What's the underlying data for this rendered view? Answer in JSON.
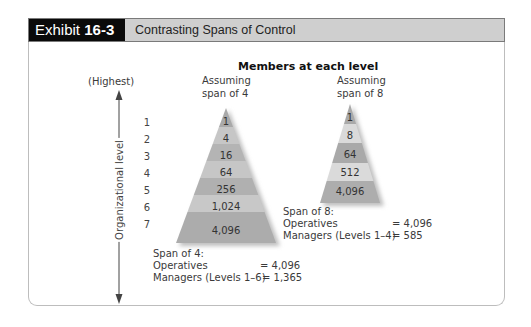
{
  "header": {
    "exhibit_prefix": "Exhibit",
    "exhibit_number": "16-3",
    "title": "Contrasting Spans of Control"
  },
  "diagram": {
    "title": "Members at each level",
    "axis": {
      "top_label": "(Highest)",
      "label": "Organizational level",
      "levels": [
        "1",
        "2",
        "3",
        "4",
        "5",
        "6",
        "7"
      ]
    },
    "pyramid_span4": {
      "caption_line1": "Assuming",
      "caption_line2": "span of 4",
      "values": [
        "1",
        "4",
        "16",
        "64",
        "256",
        "1,024",
        "4,096"
      ],
      "summary": {
        "heading": "Span of 4:",
        "operatives_label": "Operatives",
        "operatives_value": "= 4,096",
        "managers_label": "Managers (Levels 1–6)",
        "managers_value": "= 1,365"
      }
    },
    "pyramid_span8": {
      "caption_line1": "Assuming",
      "caption_line2": "span of 8",
      "values": [
        "1",
        "8",
        "64",
        "512",
        "4,096"
      ],
      "summary": {
        "heading": "Span of 8:",
        "operatives_label": "Operatives",
        "operatives_value": "= 4,096",
        "managers_label": "Managers (Levels 1–4)",
        "managers_value": "= 585"
      }
    },
    "colors": {
      "band_dark": "#a9a9a9",
      "band_light": "#c4c4c4",
      "band_lighter": "#dcdcdc",
      "header_bg": "#cfcfcf",
      "tag_bg": "#0a0a0a"
    }
  }
}
